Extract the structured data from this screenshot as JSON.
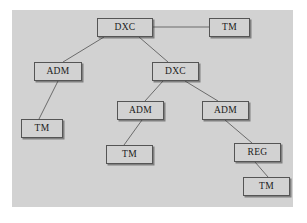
{
  "diagram": {
    "type": "tree",
    "canvas": {
      "width": 307,
      "height": 223
    },
    "panel": {
      "background_color": "#d2d2d2",
      "x": 12,
      "y": 10,
      "width": 281,
      "height": 197
    },
    "style": {
      "node_fill": "#d2d2d2",
      "node_border_color": "#555555",
      "edge_color": "#6b6b6b",
      "text_color": "#1a1a1a",
      "page_background": "#ffffff"
    },
    "nodes": [
      {
        "id": "dxc-root",
        "label": "DXC",
        "x": 97,
        "y": 18,
        "width": 56,
        "height": 19
      },
      {
        "id": "tm-top",
        "label": "TM",
        "x": 209,
        "y": 18,
        "width": 41,
        "height": 19
      },
      {
        "id": "adm-left",
        "label": "ADM",
        "x": 34,
        "y": 62,
        "width": 48,
        "height": 19
      },
      {
        "id": "dxc-mid",
        "label": "DXC",
        "x": 152,
        "y": 62,
        "width": 47,
        "height": 19
      },
      {
        "id": "tm-left",
        "label": "TM",
        "x": 21,
        "y": 119,
        "width": 42,
        "height": 19
      },
      {
        "id": "adm-mid",
        "label": "ADM",
        "x": 117,
        "y": 101,
        "width": 47,
        "height": 19
      },
      {
        "id": "adm-right",
        "label": "ADM",
        "x": 202,
        "y": 101,
        "width": 47,
        "height": 19
      },
      {
        "id": "tm-mid",
        "label": "TM",
        "x": 106,
        "y": 145,
        "width": 47,
        "height": 19
      },
      {
        "id": "reg-right",
        "label": "REG",
        "x": 234,
        "y": 143,
        "width": 47,
        "height": 19
      },
      {
        "id": "tm-bottom",
        "label": "TM",
        "x": 243,
        "y": 177,
        "width": 47,
        "height": 19
      }
    ],
    "edges": [
      {
        "id": "e1",
        "from": "dxc-root",
        "to": "tm-top",
        "x1": 153,
        "y1": 27,
        "x2": 209,
        "y2": 27
      },
      {
        "id": "e2",
        "from": "dxc-root",
        "to": "adm-left",
        "x1": 104,
        "y1": 37,
        "x2": 63,
        "y2": 62
      },
      {
        "id": "e3",
        "from": "dxc-root",
        "to": "dxc-mid",
        "x1": 139,
        "y1": 37,
        "x2": 168,
        "y2": 62
      },
      {
        "id": "e4",
        "from": "adm-left",
        "to": "tm-left",
        "x1": 58,
        "y1": 81,
        "x2": 39,
        "y2": 119
      },
      {
        "id": "e5",
        "from": "dxc-mid",
        "to": "adm-mid",
        "x1": 163,
        "y1": 81,
        "x2": 145,
        "y2": 101
      },
      {
        "id": "e6",
        "from": "dxc-mid",
        "to": "adm-right",
        "x1": 185,
        "y1": 81,
        "x2": 218,
        "y2": 101
      },
      {
        "id": "e7",
        "from": "adm-mid",
        "to": "tm-mid",
        "x1": 142,
        "y1": 120,
        "x2": 124,
        "y2": 145
      },
      {
        "id": "e8",
        "from": "adm-right",
        "to": "reg-right",
        "x1": 225,
        "y1": 120,
        "x2": 252,
        "y2": 143
      },
      {
        "id": "e9",
        "from": "reg-right",
        "to": "tm-bottom",
        "x1": 255,
        "y1": 162,
        "x2": 268,
        "y2": 177
      }
    ]
  }
}
